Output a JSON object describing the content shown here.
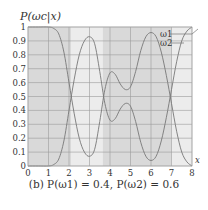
{
  "chart_data": {
    "type": "line",
    "title": "",
    "caption": "(b) P(ω1) = 0.4,  P(ω2) = 0.6",
    "xlabel": "x",
    "ylabel": "P(ωc|x)",
    "xlim": [
      0,
      8
    ],
    "ylim": [
      0,
      1
    ],
    "xticks": [
      "0",
      "1",
      "2",
      "3",
      "4",
      "5",
      "6",
      "7",
      "8"
    ],
    "yticks": [
      "0",
      "0.1",
      "0.2",
      "0.3",
      "0.4",
      "0.5",
      "0.6",
      "0.7",
      "0.8",
      "0.9",
      "1"
    ],
    "grid": true,
    "legend": {
      "position": "top-right",
      "entries": [
        "ω1",
        "ω2"
      ]
    },
    "decision_regions": [
      {
        "from": 0,
        "to": 2.1,
        "class": "ω1",
        "shade": "#d9d9d9"
      },
      {
        "from": 2.1,
        "to": 3.65,
        "class": "ω2",
        "shade": "#ececec"
      },
      {
        "from": 3.65,
        "to": 7.0,
        "class": "ω1",
        "shade": "#d9d9d9"
      },
      {
        "from": 7.0,
        "to": 8,
        "class": "ω2",
        "shade": "#ececec"
      }
    ],
    "x": [
      0,
      0.5,
      1,
      1.25,
      1.5,
      1.75,
      2,
      2.25,
      2.5,
      2.75,
      3,
      3.25,
      3.5,
      3.75,
      4,
      4.25,
      4.5,
      4.75,
      5,
      5.25,
      5.5,
      5.75,
      6,
      6.25,
      6.5,
      6.75,
      7,
      7.25,
      7.5,
      7.75,
      8
    ],
    "series": [
      {
        "name": "ω1",
        "values": [
          1,
          1,
          1,
          0.99,
          0.95,
          0.82,
          0.6,
          0.38,
          0.2,
          0.1,
          0.07,
          0.12,
          0.32,
          0.55,
          0.67,
          0.66,
          0.59,
          0.55,
          0.57,
          0.68,
          0.83,
          0.93,
          0.96,
          0.93,
          0.82,
          0.65,
          0.45,
          0.25,
          0.1,
          0.03,
          0
        ]
      },
      {
        "name": "ω2",
        "values": [
          0,
          0,
          0,
          0.01,
          0.05,
          0.18,
          0.4,
          0.62,
          0.8,
          0.9,
          0.93,
          0.88,
          0.68,
          0.45,
          0.33,
          0.34,
          0.41,
          0.45,
          0.43,
          0.32,
          0.17,
          0.07,
          0.04,
          0.07,
          0.18,
          0.35,
          0.55,
          0.75,
          0.9,
          0.97,
          1
        ]
      }
    ]
  },
  "labels": {
    "ylabel": "P(ωc|x)",
    "xlabel": "x",
    "legend_1": "ω1",
    "legend_2": "ω2",
    "caption": "(b) P(ω1) = 0.4,  P(ω2) = 0.6"
  }
}
